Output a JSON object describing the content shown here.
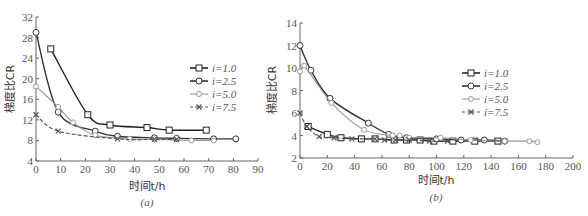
{
  "chart_data": [
    {
      "type": "line",
      "panel": "(a)",
      "title": "",
      "xlabel": "时间t/h",
      "ylabel": "梯度比CR",
      "xlim": [
        0,
        90
      ],
      "ylim": [
        4,
        32
      ],
      "xticks": [
        0,
        10,
        20,
        30,
        40,
        50,
        60,
        70,
        80,
        90
      ],
      "yticks": [
        4,
        8,
        12,
        16,
        20,
        24,
        28,
        32
      ],
      "grid": false,
      "legend_position": "right",
      "series": [
        {
          "name": "i=1.0",
          "marker": "square",
          "style": "solid",
          "color": "#222222",
          "x": [
            6,
            21,
            30,
            45,
            54,
            69
          ],
          "y": [
            25.8,
            13.0,
            11.0,
            10.5,
            10.0,
            10.0
          ]
        },
        {
          "name": "i=2.5",
          "marker": "circle",
          "style": "solid",
          "color": "#333333",
          "x": [
            0,
            9,
            24,
            33,
            48,
            57,
            72,
            81
          ],
          "y": [
            29.0,
            13.5,
            9.8,
            8.8,
            8.5,
            8.4,
            8.3,
            8.3
          ]
        },
        {
          "name": "i=5.0",
          "marker": "diamond",
          "style": "solid",
          "color": "#999999",
          "x": [
            0,
            9,
            15,
            24,
            38,
            48,
            63,
            72
          ],
          "y": [
            18.5,
            14.5,
            11.5,
            9.0,
            8.3,
            8.2,
            8.0,
            8.0
          ]
        },
        {
          "name": "i=7.5",
          "marker": "x",
          "style": "dashed",
          "color": "#555555",
          "x": [
            0,
            9,
            33,
            48,
            57
          ],
          "y": [
            13.0,
            9.8,
            8.3,
            8.2,
            8.2
          ]
        }
      ]
    },
    {
      "type": "line",
      "panel": "(b)",
      "title": "",
      "xlabel": "时间t/h",
      "ylabel": "梯度比CR",
      "xlim": [
        0,
        200
      ],
      "ylim": [
        2,
        14
      ],
      "xticks": [
        0,
        20,
        40,
        60,
        80,
        100,
        120,
        140,
        160,
        180,
        200
      ],
      "yticks": [
        2,
        4,
        6,
        8,
        10,
        12,
        14
      ],
      "grid": false,
      "legend_position": "right",
      "series": [
        {
          "name": "i=1.0",
          "marker": "square",
          "style": "solid",
          "color": "#222222",
          "x": [
            6,
            20,
            30,
            45,
            55,
            69,
            78,
            88,
            98,
            112,
            128,
            145
          ],
          "y": [
            4.8,
            4.1,
            3.8,
            3.7,
            3.7,
            3.6,
            3.6,
            3.6,
            3.5,
            3.5,
            3.5,
            3.5
          ]
        },
        {
          "name": "i=2.5",
          "marker": "circle",
          "style": "solid",
          "color": "#333333",
          "x": [
            0,
            8,
            22,
            50,
            65,
            78,
            100,
            118,
            135,
            150
          ],
          "y": [
            12.0,
            9.8,
            7.3,
            5.1,
            4.1,
            3.8,
            3.7,
            3.6,
            3.6,
            3.5
          ]
        },
        {
          "name": "i=5.0",
          "marker": "diamond",
          "style": "solid",
          "color": "#999999",
          "x": [
            0,
            3,
            23,
            47,
            68,
            73,
            80,
            103,
            125,
            150,
            168,
            174
          ],
          "y": [
            9.7,
            10.2,
            6.9,
            4.5,
            4.0,
            4.0,
            3.8,
            3.8,
            3.6,
            3.5,
            3.5,
            3.4
          ]
        },
        {
          "name": "i=7.5",
          "marker": "x",
          "style": "dashed",
          "color": "#555555",
          "x": [
            0,
            5,
            14,
            25,
            38,
            55,
            62,
            70,
            80,
            95,
            108
          ],
          "y": [
            6.0,
            4.8,
            3.9,
            3.8,
            3.7,
            3.7,
            3.6,
            3.6,
            3.6,
            3.5,
            3.5
          ]
        }
      ]
    }
  ],
  "legend_label_prefix": "i",
  "panels": [
    {
      "label": "(a)"
    },
    {
      "label": "(b)"
    }
  ]
}
